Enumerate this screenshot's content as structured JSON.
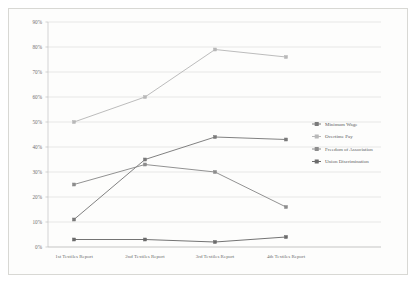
{
  "chart_data": {
    "type": "line",
    "title": "",
    "xlabel": "",
    "ylabel": "",
    "ylim": [
      0,
      90
    ],
    "grid": true,
    "legend_position": "right",
    "categories": [
      "1st Textiles Report",
      "2nd Textiles Report",
      "3rd Textiles Report",
      "4th Textiles Report"
    ],
    "ytick_labels": [
      "90%",
      "80%",
      "70%",
      "60%",
      "50%",
      "40%",
      "30%",
      "20%",
      "10%",
      "0%"
    ],
    "ytick_values": [
      90,
      80,
      70,
      60,
      50,
      40,
      30,
      20,
      10,
      0
    ],
    "series": [
      {
        "name": "Minimum Wage",
        "color": "#7a7a7a",
        "values": [
          11,
          35,
          44,
          43
        ]
      },
      {
        "name": "Overtime Pay",
        "color": "#b8b8b8",
        "values": [
          50,
          60,
          79,
          76
        ]
      },
      {
        "name": "Freedom of Association",
        "color": "#8c8c8c",
        "values": [
          25,
          33,
          30,
          16
        ]
      },
      {
        "name": "Union Discrimination",
        "color": "#6b6b6b",
        "values": [
          3,
          3,
          2,
          4
        ]
      }
    ]
  },
  "legend": {
    "entries": [
      {
        "label": "Minimum Wage"
      },
      {
        "label": "Overtime Pay"
      },
      {
        "label": "Freedom of Association"
      },
      {
        "label": "Union Discrimination"
      }
    ]
  }
}
